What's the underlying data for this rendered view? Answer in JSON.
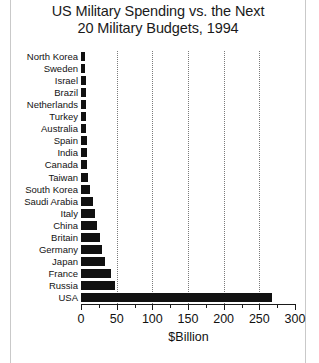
{
  "chart_data": {
    "type": "bar",
    "orientation": "horizontal",
    "title": "US Military Spending vs. the Next 20 Military Budgets, 1994",
    "title_line1": "US Military Spending vs. the Next",
    "title_line2": "20 Military Budgets, 1994",
    "xlabel": "$Billion",
    "ylabel": "",
    "xlim": [
      0,
      300
    ],
    "xticks": [
      0,
      50,
      100,
      150,
      200,
      250,
      300
    ],
    "xtick_labels": [
      "0",
      "50",
      "100",
      "150",
      "200",
      "250",
      "300"
    ],
    "xminor_step": 25,
    "grid": "vertical-dotted",
    "legend": "none",
    "bar_color": "#111111",
    "categories": [
      "North Korea",
      "Sweden",
      "Israel",
      "Brazil",
      "Netherlands",
      "Turkey",
      "Australia",
      "Spain",
      "India",
      "Canada",
      "Taiwan",
      "South Korea",
      "Saudi Arabia",
      "Italy",
      "China",
      "Britain",
      "Germany",
      "Japan",
      "France",
      "Russia",
      "USA"
    ],
    "values": [
      6,
      6,
      7,
      7,
      7,
      7,
      7,
      8,
      8,
      9,
      10,
      12,
      17,
      20,
      22,
      26,
      30,
      34,
      42,
      47,
      268
    ]
  },
  "axis": {
    "x_title": "$Billion"
  }
}
